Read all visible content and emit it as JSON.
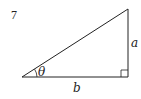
{
  "problem_number": "7",
  "diagram": {
    "type": "right-triangle",
    "labels": {
      "vertical_side": "a",
      "horizontal_side": "b",
      "angle": "θ"
    },
    "colors": {
      "stroke": "#222222",
      "background": "#ffffff"
    }
  }
}
